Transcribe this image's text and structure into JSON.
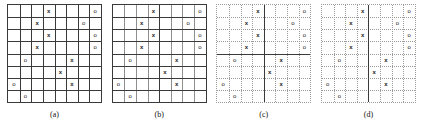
{
  "figure": {
    "rows": 8,
    "cols": 8,
    "symbol_names": {
      "x": "x-mark",
      "o": "o-mark"
    },
    "symbols": {
      "x": "x",
      "o": "o"
    },
    "colors": {
      "bold_line": "#3a3a3a",
      "light_line": "#8f8f8f",
      "dotted_line": "#9a9a9a",
      "symbol": "#1a1a1a",
      "background": "#ffffff"
    },
    "marks": [
      {
        "row": 1,
        "col": 4,
        "type": "x"
      },
      {
        "row": 1,
        "col": 8,
        "type": "o"
      },
      {
        "row": 2,
        "col": 3,
        "type": "x"
      },
      {
        "row": 2,
        "col": 7,
        "type": "o"
      },
      {
        "row": 3,
        "col": 4,
        "type": "x"
      },
      {
        "row": 3,
        "col": 8,
        "type": "o"
      },
      {
        "row": 4,
        "col": 3,
        "type": "x"
      },
      {
        "row": 4,
        "col": 8,
        "type": "o"
      },
      {
        "row": 5,
        "col": 2,
        "type": "o"
      },
      {
        "row": 5,
        "col": 6,
        "type": "x"
      },
      {
        "row": 6,
        "col": 5,
        "type": "x"
      },
      {
        "row": 7,
        "col": 1,
        "type": "o"
      },
      {
        "row": 7,
        "col": 6,
        "type": "x"
      },
      {
        "row": 8,
        "col": 2,
        "type": "o"
      }
    ],
    "panels": [
      {
        "id": "a",
        "caption": "(a)",
        "style": "all-bold",
        "description": "full 8x8 grid with all gridlines bold",
        "bold_columns": [
          1,
          2,
          3,
          4,
          5,
          6,
          7
        ],
        "bold_rows": [
          1,
          2,
          3,
          4,
          5,
          6,
          7
        ],
        "light_columns": [],
        "light_rows": [],
        "dotted_columns": [],
        "dotted_rows": []
      },
      {
        "id": "b",
        "caption": "(b)",
        "style": "bold-rows-one-bold-column",
        "description": "bold horizontal lines, light vertical lines, single bold vertical at column 4",
        "bold_columns": [
          4
        ],
        "bold_rows": [
          1,
          2,
          3,
          4,
          5,
          6,
          7
        ],
        "light_columns": [
          1,
          2,
          3,
          5,
          6,
          7
        ],
        "light_rows": [],
        "dotted_columns": [],
        "dotted_rows": []
      },
      {
        "id": "c",
        "caption": "(c)",
        "style": "dotted-with-bold-cross",
        "description": "dotted gridlines with a bold cross at row 4 and column 4",
        "bold_columns": [
          4
        ],
        "bold_rows": [
          4
        ],
        "light_columns": [],
        "light_rows": [],
        "dotted_columns": [
          1,
          2,
          3,
          5,
          6,
          7
        ],
        "dotted_rows": [
          1,
          2,
          3,
          5,
          6,
          7
        ]
      },
      {
        "id": "d",
        "caption": "(d)",
        "style": "dotted-with-one-bold-column",
        "description": "dotted gridlines with a single bold vertical line at column 4",
        "bold_columns": [
          4
        ],
        "bold_rows": [],
        "light_columns": [],
        "light_rows": [],
        "dotted_columns": [
          1,
          2,
          3,
          5,
          6,
          7
        ],
        "dotted_rows": [
          1,
          2,
          3,
          4,
          5,
          6,
          7
        ]
      }
    ]
  }
}
